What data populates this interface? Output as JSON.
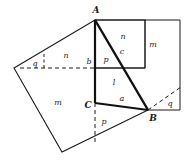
{
  "figure": {
    "width": 186,
    "height": 164,
    "background": "#ffffff",
    "stroke_color": "#1a1a1a",
    "label_color": "#1a1a1a"
  },
  "vertices": {
    "A": {
      "label": "A",
      "x": 95,
      "y": 20,
      "label_x": 96,
      "label_y": 11
    },
    "B": {
      "label": "B",
      "x": 148,
      "y": 110,
      "label_x": 152,
      "label_y": 117
    },
    "C": {
      "label": "C",
      "x": 95,
      "y": 103,
      "label_x": 88,
      "label_y": 105
    }
  },
  "geometry": {
    "triangle": "95,20 148,110 95,103",
    "square_on_b_outer": "14,68 95,20 95,103 62,152",
    "left_quad": "14,68 95,20 95,103 62,152",
    "right_rect": "95,20 180,20 180,110 148,110",
    "inner_rect_top": "95,20 145,20 145,68 95,68",
    "right_tall_rect": "145,20 180,20 180,68 145,68",
    "mid_rect": "95,68 145,68 145,110 95,110",
    "bottom_quad": "62,152 95,103 148,110",
    "dashed_horizontal": "20,68 95,68",
    "dashed_vertical_bottom": "95,103 95,140",
    "dashed_diagonal_right": "148,110 180,88",
    "dashed_left_tick": "44,55 44,68",
    "big_quad": "14,68 95,20 148,110 62,152"
  },
  "labels": [
    {
      "id": "label-q-left",
      "text": "q",
      "x": 35,
      "y": 64,
      "size": "small"
    },
    {
      "id": "label-n-left",
      "text": "n",
      "x": 66,
      "y": 56,
      "size": "small"
    },
    {
      "id": "label-m-left",
      "text": "m",
      "x": 58,
      "y": 103,
      "size": "small"
    },
    {
      "id": "label-b",
      "text": "b",
      "x": 89,
      "y": 62,
      "size": "small"
    },
    {
      "id": "label-p-center",
      "text": "p",
      "x": 106,
      "y": 60,
      "size": "small"
    },
    {
      "id": "label-c",
      "text": "c",
      "x": 122,
      "y": 52,
      "size": "small"
    },
    {
      "id": "label-n-right",
      "text": "n",
      "x": 123,
      "y": 37,
      "size": "small"
    },
    {
      "id": "label-m-right",
      "text": "m",
      "x": 153,
      "y": 45,
      "size": "small"
    },
    {
      "id": "label-l",
      "text": "l",
      "x": 114,
      "y": 83,
      "size": "small"
    },
    {
      "id": "label-a",
      "text": "a",
      "x": 122,
      "y": 99,
      "size": "small"
    },
    {
      "id": "label-q-right",
      "text": "q",
      "x": 170,
      "y": 104,
      "size": "small"
    },
    {
      "id": "label-p-bottom",
      "text": "p",
      "x": 104,
      "y": 122,
      "size": "small"
    }
  ]
}
